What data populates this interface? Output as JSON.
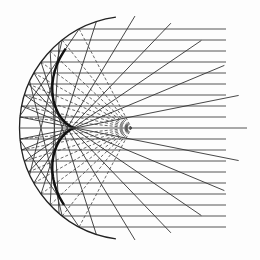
{
  "diagram": {
    "title": "",
    "type": "spherical-mirror-caustic",
    "colors": {
      "background": "#fdfdfd",
      "ray": "#555555",
      "reflected": "#333333",
      "radius_dashed": "#444444",
      "mirror": "#222222",
      "caustic": "#111111"
    },
    "mirror": {
      "center_x": 131.5,
      "center_y": 128,
      "radius": 112,
      "start_angle_deg": 98,
      "end_angle_deg": 262
    },
    "rays": {
      "spacing": 11,
      "count_each_side": 9,
      "end_x": 226,
      "axis_end_x": 247
    },
    "caustic": {
      "cusp_x": 70,
      "cusp_y": 127
    }
  }
}
